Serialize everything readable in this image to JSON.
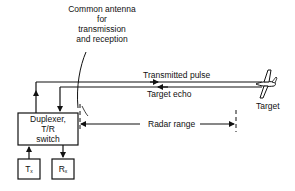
{
  "diagram": {
    "antenna_label": [
      "Common antenna",
      "for",
      "transmission",
      "and reception"
    ],
    "duplexer_label": [
      "Duplexer,",
      "T/R",
      "switch"
    ],
    "tx_label": "T",
    "tx_sub": "x",
    "rx_label": "R",
    "rx_sub": "x",
    "transmitted_pulse_label": "Transmitted pulse",
    "target_echo_label": "Target echo",
    "target_label": "Target",
    "radar_range_label": "Radar range",
    "icons": {
      "target": "aircraft-icon",
      "antenna": "antenna-icon"
    },
    "colors": {
      "line": "#111111",
      "background": "#ffffff"
    }
  }
}
